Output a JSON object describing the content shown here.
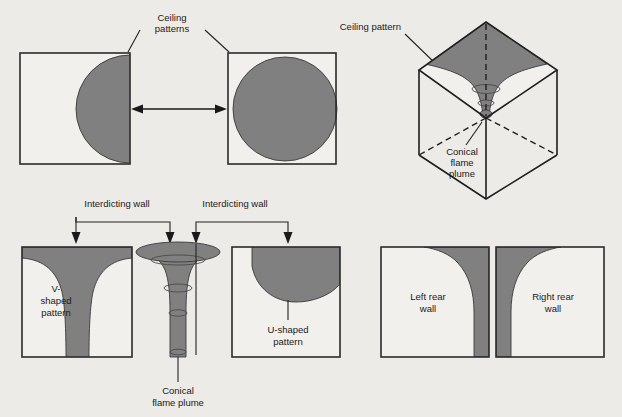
{
  "figure": {
    "background_color": "#edebe7",
    "shade_color": "#808080",
    "outline_color": "#2b2b2b"
  },
  "panels": {
    "ceiling_patterns": {
      "label": "Ceiling",
      "label_line2": "patterns",
      "left_box_name": "half-circle ceiling pattern",
      "right_box_name": "full-circle ceiling pattern"
    },
    "cube": {
      "label": "Ceiling pattern",
      "plume_label_line1": "Conical",
      "plume_label_line2": "flame",
      "plume_label_line3": "plume"
    },
    "wall_patterns": {
      "interdicting_wall_left": "Interdicting wall",
      "interdicting_wall_right": "Interdicting wall",
      "v_label_line1": "V-",
      "v_label_line2": "shaped",
      "v_label_line3": "pattern",
      "u_label_line1": "U-shaped",
      "u_label_line2": "pattern",
      "plume_label_line1": "Conical",
      "plume_label_line2": "flame plume"
    },
    "rear_walls": {
      "left_line1": "Left rear",
      "left_line2": "wall",
      "right_line1": "Right rear",
      "right_line2": "wall"
    }
  }
}
